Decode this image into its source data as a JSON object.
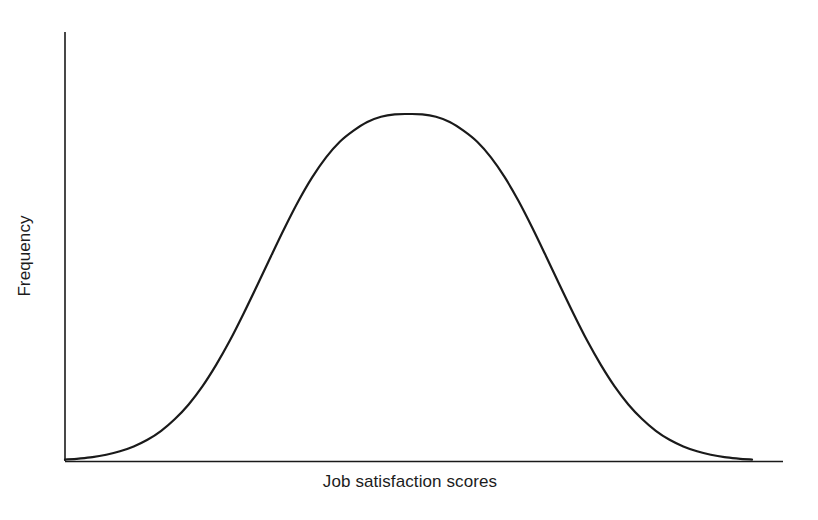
{
  "figure": {
    "background_color": "#ffffff",
    "line_color": "#1a1a1a",
    "axis_color": "#1a1a1a",
    "title": ""
  },
  "axes": {
    "y_label": "Frequency",
    "x_label": "Job satisfaction scores"
  },
  "chart_data": {
    "type": "line",
    "title": "",
    "subtitle": "",
    "xlabel": "Job satisfaction scores",
    "ylabel": "Frequency",
    "grid": false,
    "legend": false,
    "legend_position": "none",
    "axis_ticks": false,
    "tick_labels": {
      "x": [],
      "y": []
    },
    "distribution": "normal",
    "mean": 0.5,
    "std_dev": 0.165,
    "peak_x": 0.5,
    "peak_y": 1.0,
    "xlim": [
      0,
      1
    ],
    "ylim": [
      0,
      1.08
    ],
    "x": [
      0,
      0.02,
      0.04,
      0.06,
      0.08,
      0.1,
      0.12,
      0.14,
      0.16,
      0.18,
      0.2,
      0.22,
      0.24,
      0.26,
      0.28,
      0.3,
      0.32,
      0.34,
      0.36,
      0.38,
      0.4,
      0.42,
      0.44,
      0.46,
      0.48,
      0.5,
      0.52,
      0.54,
      0.56,
      0.58,
      0.6,
      0.62,
      0.64,
      0.66,
      0.68,
      0.7,
      0.72,
      0.74,
      0.76,
      0.78,
      0.8,
      0.82,
      0.84,
      0.86,
      0.88,
      0.9,
      0.92,
      0.94,
      0.96,
      0.98,
      1
    ],
    "y": [
      0.004,
      0.007,
      0.011,
      0.018,
      0.028,
      0.042,
      0.061,
      0.087,
      0.121,
      0.163,
      0.215,
      0.277,
      0.347,
      0.425,
      0.507,
      0.591,
      0.673,
      0.75,
      0.818,
      0.875,
      0.92,
      0.952,
      0.977,
      0.992,
      0.999,
      1.0,
      0.999,
      0.992,
      0.977,
      0.952,
      0.92,
      0.875,
      0.818,
      0.75,
      0.673,
      0.591,
      0.507,
      0.425,
      0.347,
      0.277,
      0.215,
      0.163,
      0.121,
      0.087,
      0.061,
      0.042,
      0.028,
      0.018,
      0.011,
      0.007,
      0.004
    ],
    "series": [
      {
        "name": "Job satisfaction score distribution",
        "color": "#1a1a1a",
        "line_width": 2.2,
        "values": [
          0.004,
          0.007,
          0.011,
          0.018,
          0.028,
          0.042,
          0.061,
          0.087,
          0.121,
          0.163,
          0.215,
          0.277,
          0.347,
          0.425,
          0.507,
          0.591,
          0.673,
          0.75,
          0.818,
          0.875,
          0.92,
          0.952,
          0.977,
          0.992,
          0.999,
          1.0,
          0.999,
          0.992,
          0.977,
          0.952,
          0.92,
          0.875,
          0.818,
          0.75,
          0.673,
          0.591,
          0.507,
          0.425,
          0.347,
          0.277,
          0.215,
          0.163,
          0.121,
          0.087,
          0.061,
          0.042,
          0.028,
          0.018,
          0.011,
          0.007,
          0.004
        ]
      }
    ]
  }
}
